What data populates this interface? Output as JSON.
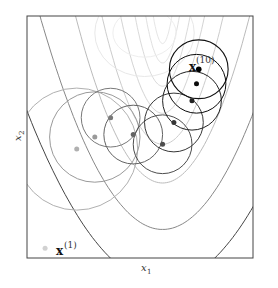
{
  "figure": {
    "title": "",
    "xlabel": "x",
    "xlabel_sub": "1",
    "ylabel": "x",
    "ylabel_sub": "2",
    "start_label": {
      "base": "x",
      "sup": "(1)"
    },
    "end_label": {
      "base": "x",
      "sup": "(10)"
    },
    "colors": {
      "frame": "#333333",
      "contour_light": "#d8d8d8",
      "contour_dark": "#444444",
      "point_final": "#000000"
    },
    "iterates": [
      {
        "step": 1,
        "x": 0.08,
        "y": 0.04,
        "shade": 0.05,
        "radius": 0.0
      },
      {
        "step": 2,
        "x": 0.22,
        "y": 0.45,
        "shade": 0.2,
        "radius": 0.27
      },
      {
        "step": 3,
        "x": 0.3,
        "y": 0.5,
        "shade": 0.3,
        "radius": 0.2
      },
      {
        "step": 4,
        "x": 0.37,
        "y": 0.58,
        "shade": 0.45,
        "radius": 0.13
      },
      {
        "step": 5,
        "x": 0.47,
        "y": 0.51,
        "shade": 0.55,
        "radius": 0.13
      },
      {
        "step": 6,
        "x": 0.6,
        "y": 0.47,
        "shade": 0.65,
        "radius": 0.13
      },
      {
        "step": 7,
        "x": 0.65,
        "y": 0.56,
        "shade": 0.75,
        "radius": 0.13
      },
      {
        "step": 8,
        "x": 0.73,
        "y": 0.65,
        "shade": 0.85,
        "radius": 0.13
      },
      {
        "step": 9,
        "x": 0.75,
        "y": 0.72,
        "shade": 0.95,
        "radius": 0.13
      }
    ]
  }
}
